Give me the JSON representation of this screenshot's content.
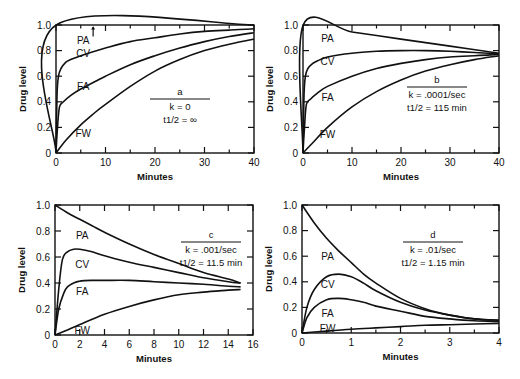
{
  "chart_data": [
    {
      "id": "a",
      "type": "line",
      "panel_label": "a",
      "annotation": [
        "k = 0",
        "t1/2 = ∞"
      ],
      "xlabel": "Minutes",
      "ylabel": "Drug level",
      "xlim": [
        0,
        40
      ],
      "ylim": [
        0,
        1.0
      ],
      "xticks": [
        0,
        10,
        20,
        30,
        40
      ],
      "yticks": [
        0,
        0.2,
        0.4,
        0.6,
        0.8,
        1.0
      ],
      "ytick_labels": [
        "0",
        "0.2",
        "0.4",
        "0.6",
        "0.8",
        "1.0"
      ],
      "grid": false,
      "box": {
        "left": 56,
        "top": 25,
        "right": 254,
        "bottom": 153
      },
      "anno_pos": {
        "x": 180,
        "y": 95
      },
      "series": [
        {
          "name": "PA",
          "label_pos": [
            5.5,
            0.88
          ],
          "x": [
            0,
            0.05,
            40
          ],
          "y": [
            0,
            1.0,
            1.0
          ]
        },
        {
          "name": "CV",
          "label_pos": [
            5.5,
            0.78
          ],
          "x": [
            0,
            0.2,
            0.5,
            1,
            2,
            3,
            5,
            10,
            15,
            20,
            25,
            30,
            35,
            40
          ],
          "y": [
            0,
            0.45,
            0.6,
            0.66,
            0.71,
            0.73,
            0.76,
            0.82,
            0.87,
            0.9,
            0.93,
            0.95,
            0.96,
            0.97
          ]
        },
        {
          "name": "FA",
          "label_pos": [
            5.5,
            0.52
          ],
          "x": [
            0,
            0.3,
            0.7,
            1.5,
            3,
            5,
            8,
            10,
            15,
            20,
            25,
            30,
            35,
            40
          ],
          "y": [
            0,
            0.2,
            0.36,
            0.4,
            0.45,
            0.5,
            0.56,
            0.6,
            0.69,
            0.76,
            0.82,
            0.87,
            0.91,
            0.94
          ]
        },
        {
          "name": "FW",
          "label_pos": [
            5.5,
            0.16
          ],
          "x": [
            0,
            2,
            5,
            8,
            10,
            15,
            20,
            25,
            30,
            35,
            40
          ],
          "y": [
            0,
            0.1,
            0.22,
            0.32,
            0.38,
            0.52,
            0.64,
            0.73,
            0.8,
            0.85,
            0.89
          ]
        }
      ]
    },
    {
      "id": "b",
      "type": "line",
      "panel_label": "b",
      "annotation": [
        "k = .0001/sec",
        "t1/2 = 115 min"
      ],
      "xlabel": "Minutes",
      "ylabel": "Drug level",
      "xlim": [
        0,
        40
      ],
      "ylim": [
        0,
        1.0
      ],
      "xticks": [
        0,
        10,
        20,
        30,
        40
      ],
      "yticks": [
        0,
        0.2,
        0.4,
        0.6,
        0.8,
        1.0
      ],
      "ytick_labels": [
        "0",
        "0.2",
        "0.4",
        "0.6",
        "0.8",
        "1.0"
      ],
      "grid": false,
      "box": {
        "left": 303,
        "top": 25,
        "right": 499,
        "bottom": 153
      },
      "anno_pos": {
        "x": 437,
        "y": 83
      },
      "series": [
        {
          "name": "PA",
          "label_pos": [
            5,
            0.9
          ],
          "x": [
            0,
            0.05,
            10,
            20,
            30,
            40
          ],
          "y": [
            0,
            1.0,
            0.945,
            0.89,
            0.835,
            0.78
          ]
        },
        {
          "name": "CV",
          "label_pos": [
            5,
            0.72
          ],
          "x": [
            0,
            0.2,
            0.5,
            1,
            2,
            3,
            5,
            10,
            15,
            20,
            25,
            30,
            35,
            40
          ],
          "y": [
            0,
            0.45,
            0.6,
            0.66,
            0.7,
            0.72,
            0.75,
            0.78,
            0.795,
            0.8,
            0.8,
            0.795,
            0.785,
            0.775
          ]
        },
        {
          "name": "FA",
          "label_pos": [
            5,
            0.44
          ],
          "x": [
            0,
            0.3,
            0.7,
            1.5,
            3,
            5,
            10,
            15,
            20,
            25,
            30,
            35,
            40
          ],
          "y": [
            0,
            0.2,
            0.38,
            0.42,
            0.47,
            0.52,
            0.6,
            0.66,
            0.7,
            0.73,
            0.75,
            0.76,
            0.77
          ]
        },
        {
          "name": "FW",
          "label_pos": [
            5,
            0.15
          ],
          "x": [
            0,
            2,
            5,
            10,
            15,
            20,
            25,
            30,
            35,
            40
          ],
          "y": [
            0,
            0.08,
            0.2,
            0.36,
            0.48,
            0.57,
            0.64,
            0.69,
            0.73,
            0.76
          ]
        }
      ]
    },
    {
      "id": "c",
      "type": "line",
      "panel_label": "c",
      "annotation": [
        "k = .001/sec",
        "t1/2 = 11.5 min"
      ],
      "xlabel": "Minutes",
      "ylabel": "Drug level",
      "xlim": [
        0,
        16
      ],
      "ylim": [
        0,
        1.0
      ],
      "xticks": [
        0,
        2,
        4,
        6,
        8,
        10,
        12,
        14,
        16
      ],
      "yticks": [
        0,
        0.2,
        0.4,
        0.6,
        0.8,
        1.0
      ],
      "ytick_labels": [
        "0",
        "0.2",
        "0.4",
        "0.6",
        "0.8",
        "1.0"
      ],
      "grid": false,
      "box": {
        "left": 55,
        "top": 205,
        "right": 253,
        "bottom": 335
      },
      "anno_pos": {
        "x": 211,
        "y": 238
      },
      "series": [
        {
          "name": "PA",
          "label_pos": [
            2.2,
            0.77
          ],
          "x": [
            0,
            1,
            2,
            3,
            4,
            6,
            8,
            10,
            12,
            14,
            15
          ],
          "y": [
            1.0,
            0.94,
            0.89,
            0.84,
            0.79,
            0.7,
            0.62,
            0.55,
            0.48,
            0.43,
            0.4
          ]
        },
        {
          "name": "CV",
          "label_pos": [
            2.2,
            0.55
          ],
          "x": [
            0,
            0.3,
            0.6,
            1,
            1.5,
            2,
            3,
            4,
            6,
            8,
            10,
            12,
            14,
            15
          ],
          "y": [
            0,
            0.35,
            0.58,
            0.64,
            0.66,
            0.66,
            0.64,
            0.61,
            0.56,
            0.52,
            0.48,
            0.44,
            0.41,
            0.4
          ]
        },
        {
          "name": "FA",
          "label_pos": [
            2.2,
            0.34
          ],
          "x": [
            0,
            0.3,
            0.7,
            1,
            1.5,
            2,
            3,
            4,
            6,
            8,
            10,
            12,
            14,
            15
          ],
          "y": [
            0,
            0.2,
            0.32,
            0.37,
            0.4,
            0.415,
            0.42,
            0.42,
            0.42,
            0.41,
            0.4,
            0.39,
            0.375,
            0.37
          ]
        },
        {
          "name": "FW",
          "label_pos": [
            2.2,
            0.035
          ],
          "x": [
            0,
            0.8,
            2,
            4,
            6,
            8,
            10,
            12,
            14,
            15
          ],
          "y": [
            0,
            0.03,
            0.08,
            0.16,
            0.22,
            0.27,
            0.31,
            0.33,
            0.345,
            0.35
          ]
        }
      ]
    },
    {
      "id": "d",
      "type": "line",
      "panel_label": "d",
      "annotation": [
        "k = .01/sec",
        "t1/2 = 1.15 min"
      ],
      "xlabel": "Minutes",
      "ylabel": "Drug level",
      "xlim": [
        0,
        4
      ],
      "ylim": [
        0,
        1.0
      ],
      "xticks": [
        0,
        1,
        2,
        3,
        4
      ],
      "yticks": [
        0,
        0.2,
        0.4,
        0.6,
        0.8,
        1.0
      ],
      "ytick_labels": [
        "0",
        "0.2",
        "0.4",
        "0.6",
        "0.8",
        "1.0"
      ],
      "grid": false,
      "box": {
        "left": 302,
        "top": 205,
        "right": 499,
        "bottom": 333
      },
      "anno_pos": {
        "x": 433,
        "y": 238
      },
      "series": [
        {
          "name": "PA",
          "label_pos": [
            0.52,
            0.6
          ],
          "x": [
            0,
            0.25,
            0.5,
            0.75,
            1,
            1.25,
            1.5,
            2,
            2.5,
            3,
            3.5,
            4
          ],
          "y": [
            1.0,
            0.86,
            0.74,
            0.64,
            0.55,
            0.46,
            0.39,
            0.27,
            0.19,
            0.14,
            0.11,
            0.1
          ]
        },
        {
          "name": "CV",
          "label_pos": [
            0.52,
            0.38
          ],
          "x": [
            0,
            0.1,
            0.25,
            0.5,
            0.75,
            1,
            1.25,
            1.5,
            2,
            2.5,
            3,
            3.5,
            4
          ],
          "y": [
            0,
            0.2,
            0.34,
            0.44,
            0.46,
            0.44,
            0.39,
            0.33,
            0.24,
            0.18,
            0.14,
            0.11,
            0.1
          ]
        },
        {
          "name": "FA",
          "label_pos": [
            0.52,
            0.16
          ],
          "x": [
            0,
            0.1,
            0.25,
            0.5,
            0.75,
            1,
            1.25,
            1.5,
            2,
            2.5,
            3,
            3.5,
            4
          ],
          "y": [
            0,
            0.12,
            0.2,
            0.26,
            0.27,
            0.26,
            0.24,
            0.21,
            0.17,
            0.13,
            0.11,
            0.095,
            0.09
          ]
        },
        {
          "name": "FW",
          "label_pos": [
            0.52,
            0.04
          ],
          "x": [
            0,
            0.5,
            1,
            1.5,
            2,
            2.5,
            3,
            3.5,
            4
          ],
          "y": [
            0,
            0.015,
            0.03,
            0.04,
            0.05,
            0.06,
            0.065,
            0.07,
            0.075
          ]
        }
      ]
    }
  ]
}
